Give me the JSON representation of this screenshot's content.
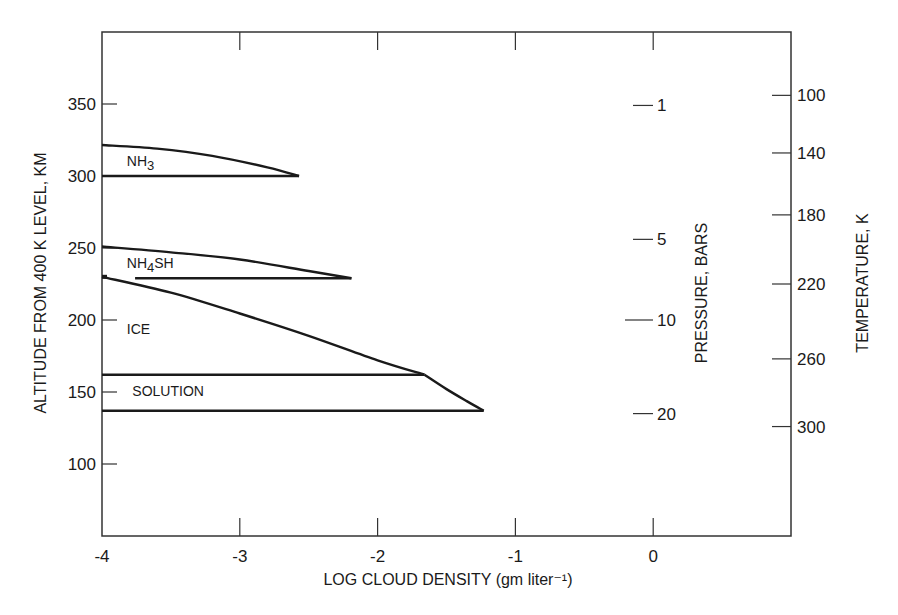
{
  "chart_data": {
    "type": "line",
    "title": "",
    "xlabel": "LOG CLOUD DENSITY (gm liter⁻¹)",
    "ylabel": "ALTITUDE FROM 400 K LEVEL, KM",
    "xlim": [
      -4,
      1
    ],
    "ylim": [
      50,
      400
    ],
    "grid": false,
    "x_ticks": [
      -4,
      -3,
      -2,
      -1,
      0
    ],
    "x_tick_labels": [
      "-4",
      "-3",
      "-2",
      "-1",
      "0"
    ],
    "y_ticks": [
      100,
      150,
      200,
      250,
      300,
      350
    ],
    "y_tick_labels": [
      "100",
      "150",
      "200",
      "250",
      "300",
      "350"
    ],
    "secondary_axes": [
      {
        "label": "PRESSURE, BARS",
        "position": "inside-right",
        "ticks": [
          {
            "label": "1",
            "altitude_km": 349
          },
          {
            "label": "5",
            "altitude_km": 256
          },
          {
            "label": "10",
            "altitude_km": 200
          },
          {
            "label": "20",
            "altitude_km": 135
          }
        ]
      },
      {
        "label": "TEMPERATURE, K",
        "position": "right",
        "ticks": [
          {
            "label": "100",
            "altitude_km": 356
          },
          {
            "label": "140",
            "altitude_km": 316
          },
          {
            "label": "180",
            "altitude_km": 273
          },
          {
            "label": "220",
            "altitude_km": 225
          },
          {
            "label": "260",
            "altitude_km": 173
          },
          {
            "label": "300",
            "altitude_km": 126
          }
        ]
      }
    ],
    "series": [
      {
        "name": "NH3",
        "label_position": {
          "x": -3.82,
          "altitude_km": 307
        },
        "top_curve": [
          [
            -4,
            321.5
          ],
          [
            -3.6,
            319
          ],
          [
            -3.2,
            314
          ],
          [
            -2.8,
            306
          ],
          [
            -2.57,
            300
          ]
        ],
        "base_curve": [
          [
            -4,
            300
          ],
          [
            -2.57,
            300
          ]
        ]
      },
      {
        "name": "NH4SH",
        "label_position": {
          "x": -3.82,
          "altitude_km": 236
        },
        "top_curve": [
          [
            -4,
            251
          ],
          [
            -3.5,
            247
          ],
          [
            -3.0,
            242
          ],
          [
            -2.5,
            234
          ],
          [
            -2.19,
            229
          ]
        ],
        "base_curve": [
          [
            -3.76,
            229
          ],
          [
            -2.19,
            229
          ]
        ]
      },
      {
        "name": "ICE",
        "label_position": {
          "x": -3.82,
          "altitude_km": 190
        },
        "top_curve": [
          [
            -4,
            230
          ],
          [
            -3.5,
            219
          ],
          [
            -3.0,
            204.5
          ],
          [
            -2.5,
            189
          ],
          [
            -2.0,
            172
          ],
          [
            -1.66,
            162
          ]
        ],
        "base_curve": [
          [
            -4,
            162
          ],
          [
            -1.66,
            162
          ]
        ]
      },
      {
        "name": "SOLUTION",
        "label_position": {
          "x": -3.78,
          "altitude_km": 147
        },
        "top_curve": [
          [
            -1.66,
            162
          ],
          [
            -1.5,
            152
          ],
          [
            -1.35,
            143.5
          ],
          [
            -1.23,
            137
          ]
        ],
        "base_curve": [
          [
            -4,
            137
          ],
          [
            -1.23,
            137
          ]
        ]
      }
    ]
  }
}
